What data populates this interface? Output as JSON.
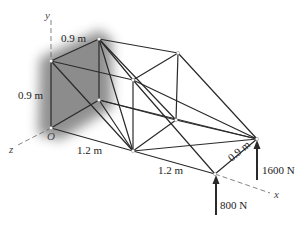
{
  "figure": {
    "axes": {
      "x": "x",
      "y": "y",
      "z": "z",
      "origin": "O"
    },
    "dimensions": {
      "top_depth": "0.9 m",
      "left_height": "0.9 m",
      "front_span_1": "1.2 m",
      "front_span_2": "1.2 m",
      "right_depth": "0.9 m"
    },
    "loads": {
      "front_right": "800 N",
      "back_right": "1600 N"
    },
    "colors": {
      "member": "#2a2a2a",
      "support_wall": "#8a8a8a",
      "axis_dash": "#666666"
    }
  }
}
